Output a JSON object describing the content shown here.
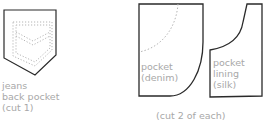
{
  "diagram": {
    "pieces": [
      {
        "id": "back-pocket",
        "label_lines": [
          "jeans",
          "back pocket",
          "(cut 1)"
        ]
      },
      {
        "id": "pocket-denim",
        "label_lines": [
          "pocket",
          "(denim)"
        ]
      },
      {
        "id": "pocket-lining",
        "label_lines": [
          "pocket",
          "lining",
          "(silk)"
        ]
      }
    ],
    "footnote": "(cut 2 of each)",
    "colors": {
      "outline": "#2a2a2a",
      "stitch": "#b5b5b5",
      "label": "#a8a8a8"
    }
  }
}
